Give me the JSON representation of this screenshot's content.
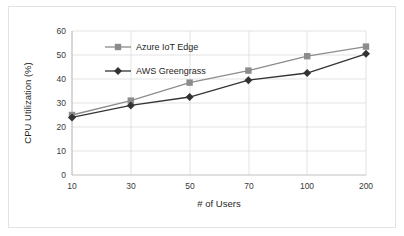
{
  "chart_data": {
    "type": "line",
    "title": "",
    "xlabel": "# of Users",
    "ylabel": "CPU Utilization (%)",
    "categories": [
      "10",
      "30",
      "50",
      "70",
      "100",
      "200"
    ],
    "ylim": [
      0,
      60
    ],
    "yticks": [
      "0",
      "10",
      "20",
      "30",
      "40",
      "50",
      "60"
    ],
    "grid": true,
    "legend_position": "upper-left-inside",
    "series": [
      {
        "name": "Azure IoT Edge",
        "values": [
          25,
          31,
          38.5,
          43.5,
          49.5,
          53.5
        ],
        "color": "#8c8c8c",
        "marker": "square"
      },
      {
        "name": "AWS Greengrass",
        "values": [
          24,
          29,
          32.5,
          39.5,
          42.5,
          50.5
        ],
        "color": "#333333",
        "marker": "diamond"
      }
    ]
  },
  "axes": {
    "y_title": "CPU Utilization (%)",
    "x_title": "# of Users",
    "y_ticks": [
      "60",
      "50",
      "40",
      "30",
      "20",
      "10",
      "0"
    ],
    "x_ticks": [
      "10",
      "30",
      "50",
      "70",
      "100",
      "200"
    ]
  },
  "legend": {
    "entries": [
      {
        "label": "Azure IoT Edge",
        "marker": "square-marker",
        "color": "#8c8c8c"
      },
      {
        "label": "AWS Greengrass",
        "marker": "diamond-marker",
        "color": "#333333"
      }
    ]
  },
  "colors": {
    "azure_series": "#8c8c8c",
    "aws_series": "#333333",
    "gridline": "#dcdcdc",
    "border": "#e3e3e3",
    "background": "#ffffff"
  }
}
